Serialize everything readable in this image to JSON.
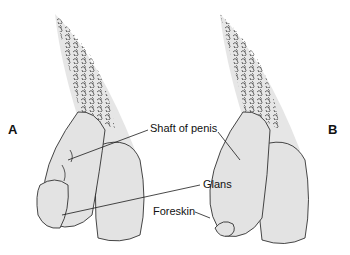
{
  "figure": {
    "panels": [
      {
        "id": "A",
        "label": "A"
      },
      {
        "id": "B",
        "label": "B"
      }
    ],
    "labels": {
      "shaft": "Shaft of penis",
      "glans": "Glans",
      "foreskin": "Foreskin"
    },
    "colors": {
      "skin_fill": "#e3e3e3",
      "outline": "#1a1a1a",
      "background": "#ffffff"
    }
  }
}
